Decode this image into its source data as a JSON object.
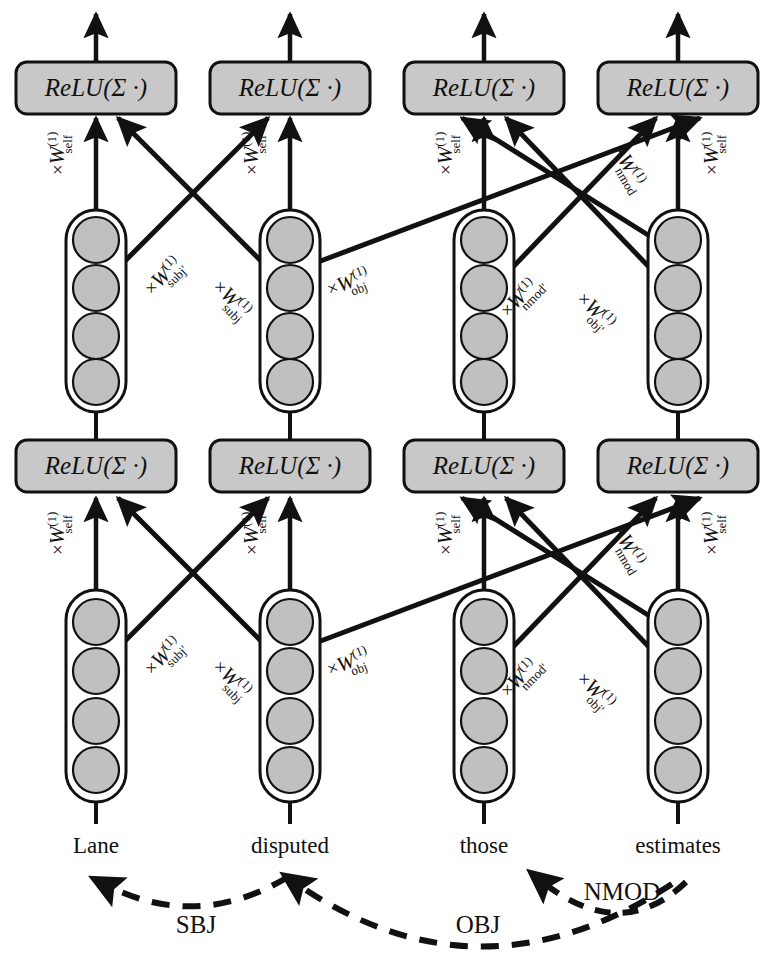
{
  "figure": {
    "background_color": "#ffffff",
    "node_fill": "#c0c0c0",
    "box_fill": "#c8c8c8",
    "stroke_color": "#111111"
  },
  "relu": {
    "label": "ReLU(Σ ·)",
    "func": "ReLU",
    "open_paren": "(",
    "sigma": "Σ",
    "dot": "·",
    "close_paren": ")"
  },
  "words": [
    {
      "id": "lane",
      "text": "Lane",
      "x": 96
    },
    {
      "id": "disputed",
      "text": "disputed",
      "x": 290
    },
    {
      "id": "those",
      "text": "those",
      "x": 484
    },
    {
      "id": "estimates",
      "text": "estimates",
      "x": 678
    }
  ],
  "layers": {
    "top_relu_row": {
      "name": "layer-2 output",
      "count": 4
    },
    "middle_vector_row": {
      "name": "layer-1 hidden vectors",
      "count": 4,
      "units_per_vector": 4
    },
    "middle_relu_row": {
      "name": "layer-1 output",
      "count": 4
    },
    "bottom_vector_row": {
      "name": "input word embeddings",
      "count": 4,
      "units_per_vector": 4
    }
  },
  "weight_labels": {
    "times": "×",
    "symbol": "W",
    "superscript": "(1)",
    "self": "self",
    "subj": "subj",
    "subj_prime": "subj'",
    "obj": "obj",
    "obj_prime": "obj'",
    "nmod": "nmod",
    "nmod_prime": "nmod'"
  },
  "upper_block_edges": [
    {
      "from_col": 1,
      "to_col": 1,
      "label_sub": "self",
      "label_x": 64,
      "label_y": 175,
      "rot": -90
    },
    {
      "from_col": 1,
      "to_col": 2,
      "label_sub": "subj'",
      "label_x": 158,
      "label_y": 282,
      "rot": -45
    },
    {
      "from_col": 2,
      "to_col": 1,
      "label_sub": "subj",
      "label_x": 218,
      "label_y": 272,
      "rot": -45
    },
    {
      "from_col": 2,
      "to_col": 2,
      "label_sub": "self",
      "label_x": 258,
      "label_y": 175,
      "rot": -90
    },
    {
      "from_col": 2,
      "to_col": 4,
      "label_sub": "obj",
      "label_x": 348,
      "label_y": 282,
      "rot": -45
    },
    {
      "from_col": 3,
      "to_col": 3,
      "label_sub": "self",
      "label_x": 452,
      "label_y": 175,
      "rot": -90
    },
    {
      "from_col": 3,
      "to_col": 4,
      "label_sub": "nmod'",
      "label_x": 540,
      "label_y": 290,
      "rot": -45
    },
    {
      "from_col": 4,
      "to_col": 3,
      "label_sub": "obj'",
      "label_x": 600,
      "label_y": 292,
      "rot": -45
    },
    {
      "from_col": 4,
      "to_col": 3,
      "label_sub": "nmod",
      "label_x": 628,
      "label_y": 170,
      "rot": -60
    },
    {
      "from_col": 4,
      "to_col": 4,
      "label_sub": "self",
      "label_x": 718,
      "label_y": 175,
      "rot": -90
    }
  ],
  "lower_block_edges": [
    {
      "from_col": 1,
      "to_col": 1,
      "label_sub": "self",
      "label_x": 64,
      "label_y": 555,
      "rot": -90
    },
    {
      "from_col": 1,
      "to_col": 2,
      "label_sub": "subj'",
      "label_x": 158,
      "label_y": 662,
      "rot": -45
    },
    {
      "from_col": 2,
      "to_col": 1,
      "label_sub": "subj",
      "label_x": 218,
      "label_y": 652,
      "rot": -45
    },
    {
      "from_col": 2,
      "to_col": 2,
      "label_sub": "self",
      "label_x": 258,
      "label_y": 555,
      "rot": -90
    },
    {
      "from_col": 2,
      "to_col": 4,
      "label_sub": "obj",
      "label_x": 348,
      "label_y": 662,
      "rot": -45
    },
    {
      "from_col": 3,
      "to_col": 3,
      "label_sub": "self",
      "label_x": 452,
      "label_y": 555,
      "rot": -90
    },
    {
      "from_col": 3,
      "to_col": 4,
      "label_sub": "nmod'",
      "label_x": 540,
      "label_y": 670,
      "rot": -45
    },
    {
      "from_col": 4,
      "to_col": 3,
      "label_sub": "obj'",
      "label_x": 600,
      "label_y": 672,
      "rot": -45
    },
    {
      "from_col": 4,
      "to_col": 3,
      "label_sub": "nmod",
      "label_x": 628,
      "label_y": 550,
      "rot": -60
    },
    {
      "from_col": 4,
      "to_col": 4,
      "label_sub": "self",
      "label_x": 718,
      "label_y": 555,
      "rot": -90
    }
  ],
  "dependency_arcs": [
    {
      "id": "sbj",
      "label": "SBJ",
      "head": "disputed",
      "dependent": "Lane",
      "label_x": 196,
      "label_y": 926
    },
    {
      "id": "obj",
      "label": "OBJ",
      "head": "estimates",
      "dependent": "disputed",
      "label_x": 478,
      "label_y": 926
    },
    {
      "id": "nmod",
      "label": "NMOD",
      "head": "estimates",
      "dependent": "those",
      "label_x": 620,
      "label_y": 895
    }
  ]
}
